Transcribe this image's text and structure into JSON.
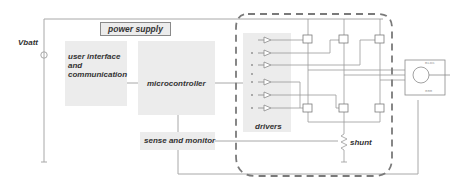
{
  "diagram": {
    "supply": {
      "label": "Vbatt"
    },
    "blocks": {
      "power_supply": "power supply",
      "user_interface": [
        "user interface",
        "and",
        "communication"
      ],
      "microcontroller": "microcontroller",
      "drivers": "drivers",
      "sense_monitor": "sense and monitor",
      "shunt": "shunt"
    },
    "motor": {
      "label": "BLDC",
      "pins": "000"
    },
    "colors": {
      "block_fill": "#ececec",
      "wire": "#9a9a9a",
      "dashed_boundary": "#7a7a7a",
      "text": "#333333"
    }
  }
}
